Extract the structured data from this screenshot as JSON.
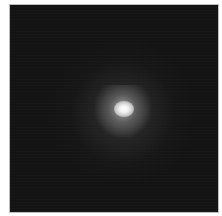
{
  "image": {
    "subject": "bright diffuse point source on dark background",
    "background_color": "#121212",
    "core_color": "#ffffff",
    "frame_color": "#bdbdbd",
    "page_color": "#ffffff"
  }
}
